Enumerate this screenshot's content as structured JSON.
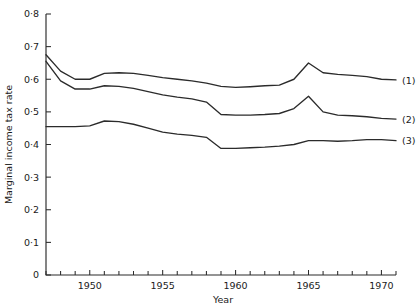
{
  "chart_data": {
    "type": "line",
    "title": "",
    "xlabel": "Year",
    "ylabel": "Marginal income tax rate",
    "xlim": [
      1947,
      1971
    ],
    "ylim": [
      0,
      0.8
    ],
    "grid": false,
    "legend": "inline-right-end-labels",
    "x": [
      1947,
      1948,
      1949,
      1950,
      1951,
      1952,
      1953,
      1954,
      1955,
      1956,
      1957,
      1958,
      1959,
      1960,
      1961,
      1962,
      1963,
      1964,
      1965,
      1966,
      1967,
      1968,
      1969,
      1970,
      1971
    ],
    "xticks": [
      1950,
      1955,
      1960,
      1965,
      1970
    ],
    "xticklabels": [
      "1950",
      "1955",
      "1960",
      "1965",
      "1970"
    ],
    "xminorticks": [
      1947,
      1948,
      1949,
      1951,
      1952,
      1953,
      1954,
      1956,
      1957,
      1958,
      1959,
      1961,
      1962,
      1963,
      1964,
      1966,
      1967,
      1968,
      1969,
      1971
    ],
    "yticks": [
      0,
      0.1,
      0.2,
      0.3,
      0.4,
      0.5,
      0.6,
      0.7,
      0.8
    ],
    "yticklabels": [
      "0",
      "0·1",
      "0·2",
      "0·3",
      "0·4",
      "0·5",
      "0·6",
      "0·7",
      "0·8"
    ],
    "series": [
      {
        "name": "(1)",
        "label": "(1)",
        "values": [
          0.675,
          0.625,
          0.6,
          0.6,
          0.618,
          0.62,
          0.618,
          0.612,
          0.605,
          0.6,
          0.595,
          0.588,
          0.578,
          0.575,
          0.577,
          0.58,
          0.582,
          0.6,
          0.65,
          0.62,
          0.615,
          0.612,
          0.608,
          0.6,
          0.598
        ]
      },
      {
        "name": "(2)",
        "label": "(2)",
        "values": [
          0.655,
          0.595,
          0.57,
          0.57,
          0.58,
          0.578,
          0.572,
          0.562,
          0.552,
          0.545,
          0.54,
          0.53,
          0.492,
          0.49,
          0.49,
          0.492,
          0.495,
          0.51,
          0.548,
          0.5,
          0.49,
          0.488,
          0.485,
          0.48,
          0.478
        ]
      },
      {
        "name": "(3)",
        "label": "(3)",
        "values": [
          0.455,
          0.455,
          0.455,
          0.457,
          0.472,
          0.47,
          0.462,
          0.45,
          0.438,
          0.432,
          0.428,
          0.422,
          0.388,
          0.388,
          0.39,
          0.392,
          0.395,
          0.4,
          0.412,
          0.412,
          0.41,
          0.412,
          0.415,
          0.415,
          0.412
        ]
      }
    ]
  }
}
